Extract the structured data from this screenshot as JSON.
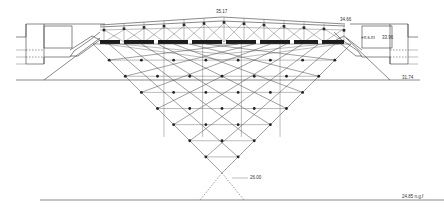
{
  "drawing": {
    "title": "Inverted pyramid section",
    "colors": {
      "ink": "#3a3a3a",
      "background": "#ffffff",
      "beam": "#1c1c1c"
    },
    "labels": {
      "roof_apex": "35.17",
      "roof_edge": "34.66",
      "upper_floor_prefix": "+n.s.m",
      "upper_floor": "33.96",
      "lower_floor": "31.74",
      "pyramid_tip": "26.00",
      "ground": "24.85 n.g.f"
    }
  }
}
